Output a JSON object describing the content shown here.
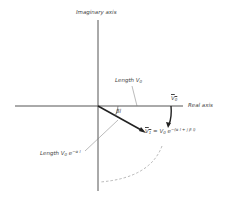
{
  "diagram": {
    "type": "complex-plane phasor diagram",
    "axes": {
      "imaginary_label": "Imaginary axis",
      "real_label": "Real axis"
    },
    "labels": {
      "length_v0": {
        "text": "Length V",
        "sub": "0"
      },
      "v0_phasor": {
        "text": "V",
        "sub": "0"
      },
      "angle": "βl",
      "v1_eq": {
        "lhs": "V",
        "lhs_sub": "1",
        "eq": " = V",
        "eq_sub": "0",
        "e": " e",
        "exp": "−(α l + j β l)"
      },
      "length_v0_decay": {
        "text": "Length V",
        "sub": "0",
        "e": " e",
        "exp": "−α l"
      }
    },
    "colors": {
      "axis": "#555555",
      "phasor": "#222222",
      "leader": "#777777",
      "dashed_arc": "#999999",
      "text": "#444444"
    }
  }
}
